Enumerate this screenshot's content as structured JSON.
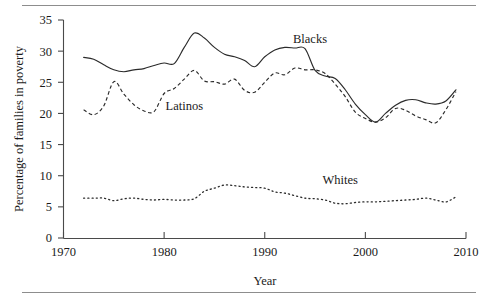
{
  "figure": {
    "has_top_rule": true,
    "has_bottom_rule": true,
    "background": "#ffffff",
    "line_color": "#2b2b2b"
  },
  "chart_data": {
    "type": "line",
    "title": "",
    "xlabel": "Year",
    "ylabel": "Percentage of families in poverty",
    "xlim": [
      1970,
      2010
    ],
    "ylim": [
      0,
      35
    ],
    "xticks": [
      1970,
      1980,
      1990,
      2000,
      2010
    ],
    "yticks": [
      0,
      5,
      10,
      15,
      20,
      25,
      30,
      35
    ],
    "grid": false,
    "legend_position": "inline-annotations",
    "annotations": [
      {
        "text": "Blacks",
        "x": 1994.5,
        "y": 31.3
      },
      {
        "text": "Latinos",
        "x": 1982.0,
        "y": 20.6
      },
      {
        "text": "Whites",
        "x": 1997.5,
        "y": 8.6
      }
    ],
    "x": [
      1972,
      1973,
      1974,
      1975,
      1976,
      1977,
      1978,
      1979,
      1980,
      1981,
      1982,
      1983,
      1984,
      1985,
      1986,
      1987,
      1988,
      1989,
      1990,
      1991,
      1992,
      1993,
      1994,
      1995,
      1996,
      1997,
      1998,
      1999,
      2000,
      2001,
      2002,
      2003,
      2004,
      2005,
      2006,
      2007,
      2008,
      2009
    ],
    "series": [
      {
        "name": "Blacks",
        "style": "solid",
        "values": [
          29.0,
          28.7,
          27.8,
          27.0,
          26.7,
          27.0,
          27.2,
          27.7,
          28.1,
          28.0,
          30.6,
          32.9,
          32.1,
          30.6,
          29.5,
          29.1,
          28.5,
          27.5,
          29.1,
          30.2,
          30.6,
          30.5,
          30.4,
          26.9,
          26.0,
          25.6,
          23.8,
          21.5,
          19.8,
          18.6,
          20.0,
          21.3,
          22.1,
          22.2,
          21.7,
          21.5,
          22.0,
          23.8
        ]
      },
      {
        "name": "Latinos",
        "style": "dashed",
        "values": [
          20.6,
          19.8,
          21.2,
          25.1,
          23.1,
          21.4,
          20.4,
          20.3,
          23.2,
          24.0,
          25.5,
          26.9,
          25.2,
          25.1,
          24.7,
          25.5,
          23.7,
          23.4,
          25.0,
          26.5,
          26.2,
          27.3,
          27.0,
          27.0,
          26.4,
          24.7,
          22.7,
          20.2,
          19.2,
          18.6,
          19.3,
          20.8,
          20.5,
          19.6,
          19.0,
          18.5,
          20.6,
          23.5
        ]
      },
      {
        "name": "Whites",
        "style": "dotted",
        "values": [
          6.4,
          6.4,
          6.4,
          6.0,
          6.3,
          6.4,
          6.2,
          6.1,
          6.2,
          6.1,
          6.1,
          6.3,
          7.5,
          8.0,
          8.5,
          8.4,
          8.2,
          8.1,
          8.0,
          7.4,
          7.2,
          6.8,
          6.4,
          6.3,
          6.1,
          5.6,
          5.5,
          5.7,
          5.8,
          5.8,
          5.9,
          6.0,
          6.1,
          6.2,
          6.4,
          6.1,
          5.8,
          6.6
        ]
      }
    ]
  }
}
